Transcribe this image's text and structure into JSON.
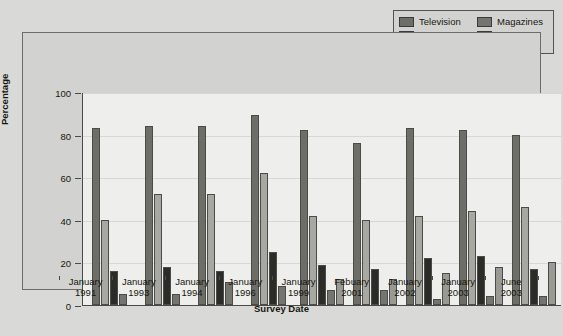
{
  "chart_data": {
    "type": "bar",
    "title": "",
    "xlabel": "Survey Date",
    "ylabel": "Percentage",
    "ylim": [
      0,
      100
    ],
    "yticks": [
      0,
      20,
      40,
      60,
      80,
      100
    ],
    "grid": true,
    "legend_position": "top-right",
    "categories": [
      "January 1991",
      "January 1993",
      "January 1994",
      "January 1996",
      "January 1999",
      "Febuary 2001",
      "January 2002",
      "January 2003",
      "June 2003"
    ],
    "category_lines": [
      [
        "January",
        "1991"
      ],
      [
        "January",
        "1993"
      ],
      [
        "January",
        "1994"
      ],
      [
        "January",
        "1996"
      ],
      [
        "January",
        "1999"
      ],
      [
        "Febuary",
        "2001"
      ],
      [
        "January",
        "2002"
      ],
      [
        "January",
        "2003"
      ],
      [
        "June",
        "2003"
      ]
    ],
    "series": [
      {
        "name": "Television",
        "color": "#6e6e69",
        "values": [
          83,
          84,
          84,
          89,
          82,
          76,
          83,
          82,
          80
        ]
      },
      {
        "name": "Newspapers",
        "color": "#a8a8a3",
        "values": [
          40,
          52,
          52,
          62,
          42,
          40,
          42,
          44,
          46
        ]
      },
      {
        "name": "Radio",
        "color": "#2b2b28",
        "values": [
          16,
          18,
          16,
          25,
          19,
          17,
          22,
          23,
          17
        ]
      },
      {
        "name": "Magazines",
        "color": "#75756f",
        "values": [
          5,
          5,
          11,
          9,
          7,
          7,
          3,
          4,
          4
        ]
      },
      {
        "name": "Internet",
        "color": "#9a9a95",
        "values": [
          null,
          null,
          null,
          null,
          12,
          12,
          15,
          18,
          20
        ]
      }
    ]
  },
  "legend": {
    "columns": [
      [
        {
          "label": "Television",
          "swatch": "#6e6e69"
        },
        {
          "label": "Newspapers",
          "swatch": "#a8a8a3"
        },
        {
          "label": "Radio",
          "swatch": "#2b2b28"
        }
      ],
      [
        {
          "label": "Magazines",
          "swatch": "#75756f"
        },
        {
          "label": "Internet",
          "swatch": "#9a9a95"
        }
      ]
    ]
  },
  "footnote": ""
}
